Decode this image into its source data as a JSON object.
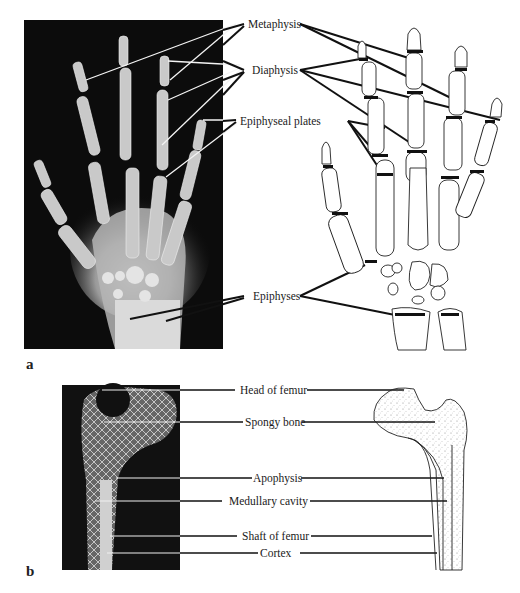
{
  "figure": {
    "panel_a": {
      "letter": "a",
      "labels": {
        "metaphysis": "Metaphysis",
        "diaphysis": "Diaphysis",
        "epiphyseal_plates": "Epiphyseal plates",
        "epiphyses": "Epiphyses"
      }
    },
    "panel_b": {
      "letter": "b",
      "labels": {
        "head_of_femur": "Head of femur",
        "spongy_bone": "Spongy bone",
        "apophysis": "Apophysis",
        "medullary_cavity": "Medullary cavity",
        "shaft_of_femur": "Shaft of femur",
        "cortex": "Cortex"
      }
    }
  }
}
